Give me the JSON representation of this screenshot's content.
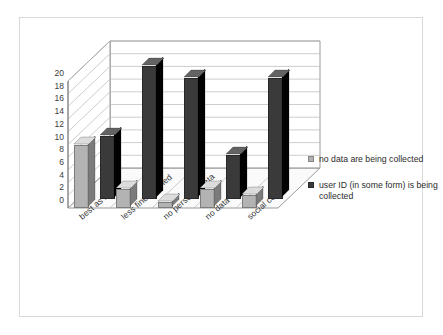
{
  "chart_data": {
    "type": "bar",
    "title": "",
    "subtitle": "",
    "xlabel": "",
    "ylabel": "",
    "ylim": [
      0,
      20
    ],
    "yticks": [
      0,
      2,
      4,
      6,
      8,
      10,
      12,
      14,
      16,
      18,
      20
    ],
    "grid": true,
    "three_d": true,
    "legend_position": "right",
    "categories": [
      "best as is",
      "less fine-grained",
      "no personal data",
      "no data",
      "social control"
    ],
    "series": [
      {
        "name": "no data are being collected",
        "color": "#b3b3b3",
        "values": [
          10,
          3,
          1,
          3,
          2
        ]
      },
      {
        "name": "user ID (in some form) is being collected",
        "color": "#3a3a3a",
        "values": [
          10,
          21,
          19,
          7,
          19
        ]
      }
    ]
  },
  "legend": {
    "entries": [
      {
        "label": "no data are being collected",
        "color": "#b3b3b3"
      },
      {
        "label": "user ID (in some form) is being collected",
        "color": "#3a3a3a"
      }
    ]
  },
  "colors": {
    "background": "#ffffff",
    "frame_border": "#d9d9d9",
    "gridline": "#b8b8b8",
    "axis": "#808080",
    "floor": "#fafafa",
    "wall": "#ffffff",
    "series_light": "#b3b3b3",
    "series_dark": "#3a3a3a",
    "text": "#333333"
  }
}
